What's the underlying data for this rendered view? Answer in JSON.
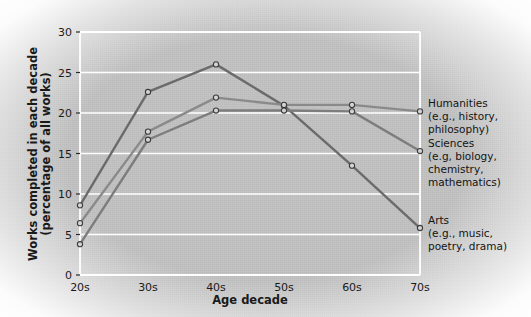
{
  "chart_data": {
    "type": "line",
    "title": "",
    "xlabel": "Age decade",
    "ylabel": "Works completed in each decade (percentage of all works)",
    "ylabel_line1": "Works completed in each decade",
    "ylabel_line2": "(percentage of all works)",
    "categories": [
      "20s",
      "30s",
      "40s",
      "50s",
      "60s",
      "70s"
    ],
    "ylim": [
      0,
      30
    ],
    "yticks": [
      0,
      5,
      10,
      15,
      20,
      25,
      30
    ],
    "ytick_labels": [
      "0",
      "5",
      "10",
      "15",
      "20",
      "25",
      "30"
    ],
    "grid": "horizontal",
    "legend_position": "right-of-axes",
    "series": [
      {
        "name": "Arts",
        "legend_lines": [
          "Arts",
          "(e.g., music,",
          "poetry, drama)"
        ],
        "color": "#6b6b6b",
        "values": [
          8.6,
          22.6,
          26.0,
          20.9,
          13.5,
          5.8
        ]
      },
      {
        "name": "Humanities",
        "legend_lines": [
          "Humanities",
          "(e.g., history,",
          "philosophy)"
        ],
        "color": "#8a8a8a",
        "values": [
          6.4,
          17.7,
          21.9,
          21.0,
          21.0,
          20.2
        ]
      },
      {
        "name": "Sciences",
        "legend_lines": [
          "Sciences",
          "(e.g, biology,",
          "chemistry,",
          "mathematics)"
        ],
        "color": "#7d7d7d",
        "values": [
          3.8,
          16.7,
          20.3,
          20.3,
          20.2,
          15.3
        ]
      }
    ],
    "marker": "open-circle",
    "plot_area_background": "#c2c2c2",
    "gridline_color": "#ffffff",
    "axis_color": "#ffffff"
  },
  "legend": {
    "entries": [
      {
        "key": "humanities",
        "lines": [
          "Humanities",
          "(e.g., history,",
          "philosophy)"
        ]
      },
      {
        "key": "sciences",
        "lines": [
          "Sciences",
          "(e.g, biology,",
          "chemistry,",
          "mathematics)"
        ]
      },
      {
        "key": "arts",
        "lines": [
          "Arts",
          "(e.g., music,",
          "poetry, drama)"
        ]
      }
    ]
  }
}
